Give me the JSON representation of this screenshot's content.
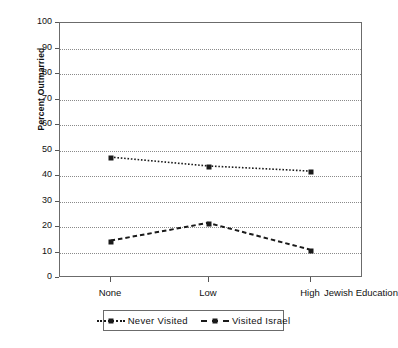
{
  "chart_data": {
    "type": "line",
    "title": "",
    "xlabel": "Jewish Education",
    "ylabel": "Percent Outmarried",
    "categories": [
      "None",
      "Low",
      "High"
    ],
    "ylim": [
      0,
      100
    ],
    "yticks": [
      0,
      10,
      20,
      30,
      40,
      50,
      60,
      70,
      80,
      90,
      100
    ],
    "grid": true,
    "legend_position": "bottom",
    "series": [
      {
        "name": "Never Visited",
        "values": [
          47,
          43.5,
          41.5
        ],
        "linestyle": "dotted",
        "marker": "square",
        "color": "#1a1a1a"
      },
      {
        "name": "Visited Israel",
        "values": [
          14,
          21,
          10.5
        ],
        "linestyle": "dashed",
        "marker": "square",
        "color": "#1a1a1a"
      }
    ]
  },
  "axes": {
    "y_tick_labels": [
      "100",
      "90",
      "80",
      "70",
      "60",
      "50",
      "40",
      "30",
      "20",
      "10",
      "0"
    ],
    "y_axis_title": "Percent Outmarried",
    "x_tick_labels": [
      "None",
      "Low",
      "High"
    ],
    "x_axis_title": "Jewish Education"
  },
  "legend": {
    "entries": [
      {
        "label": "Never Visited",
        "style": "dotted"
      },
      {
        "label": "Visited Israel",
        "style": "dashed"
      }
    ]
  }
}
